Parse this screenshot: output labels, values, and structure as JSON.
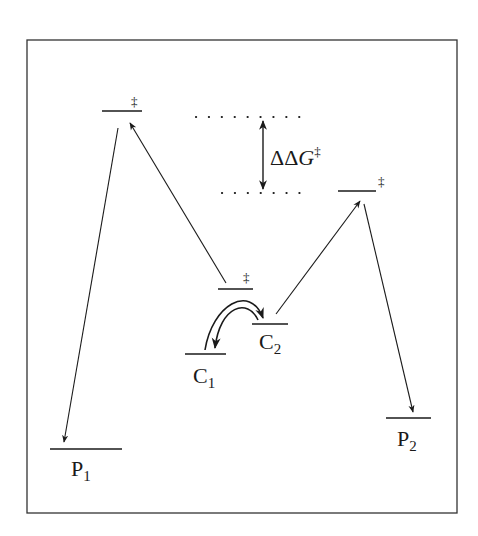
{
  "diagram": {
    "type": "energy-profile",
    "colors": {
      "line": "#1a1a1a",
      "border": "#333333",
      "background": "#ffffff"
    },
    "states": {
      "ts1": {
        "label": "",
        "mark": "‡"
      },
      "ts2": {
        "label": "",
        "mark": "‡"
      },
      "ts_interconversion": {
        "label": "",
        "mark": "‡"
      },
      "c1": {
        "letter": "C",
        "sub": "1"
      },
      "c2": {
        "letter": "C",
        "sub": "2"
      },
      "p1": {
        "letter": "P",
        "sub": "1"
      },
      "p2": {
        "letter": "P",
        "sub": "2"
      }
    },
    "annotation": {
      "delta": "ΔΔ",
      "symbol": "G",
      "mark": "‡"
    }
  }
}
